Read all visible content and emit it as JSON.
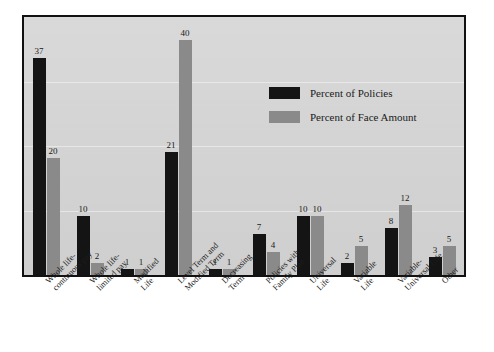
{
  "chart_data": {
    "type": "bar",
    "title": "",
    "subtitle": "",
    "xlabel": "",
    "ylabel": "",
    "ylim": [
      0,
      44
    ],
    "grid": true,
    "legend_position": "inside-top-right",
    "categories": [
      "Whole life-\ncontinuous pay",
      "Whole life-\nlimited pay",
      "Modified\nLife",
      "Level Term and\nModified Term",
      "Decreasing\nTerm",
      "Policies with\nFamily Plan",
      "Universal\nLife",
      "Variable\nLife",
      "Variable-\nUniversal Life",
      "Other"
    ],
    "series": [
      {
        "name": "Percent of Policies",
        "color": "#141414",
        "values": [
          37,
          10,
          1,
          21,
          1,
          7,
          10,
          2,
          8,
          3
        ]
      },
      {
        "name": "Percent of Face Amount",
        "color": "#8a8a8a",
        "values": [
          20,
          2,
          1,
          40,
          1,
          4,
          10,
          5,
          12,
          5
        ]
      }
    ]
  },
  "legend": {
    "items": [
      {
        "label": "Percent of Policies",
        "swatch": "black-swatch"
      },
      {
        "label": "Percent of Face Amount",
        "swatch": "gray-swatch"
      }
    ]
  },
  "xticks": [
    {
      "line1": "Whole life-",
      "line2": "continuous pay"
    },
    {
      "line1": "Whole life-",
      "line2": "limited pay"
    },
    {
      "line1": "Modified",
      "line2": "Life"
    },
    {
      "line1": "Level Term and",
      "line2": "Modified Term"
    },
    {
      "line1": "Decreasing",
      "line2": "Term"
    },
    {
      "line1": "Policies with",
      "line2": "Family Plan"
    },
    {
      "line1": "Universal",
      "line2": "Life"
    },
    {
      "line1": "Variable",
      "line2": "Life"
    },
    {
      "line1": "Variable-",
      "line2": "Universal Life"
    },
    {
      "line1": "Other",
      "line2": ""
    }
  ],
  "colors": {
    "series_policies": "#141414",
    "series_face_amount": "#8a8a8a",
    "plot_background": "#d6d6d6",
    "frame_border": "#111111",
    "page_background": "#ffffff"
  }
}
